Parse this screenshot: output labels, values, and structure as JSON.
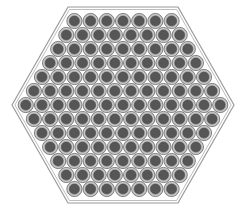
{
  "diagram": {
    "title": "",
    "type": "hexagonal-bundle-cross-section",
    "shape": "hexagon",
    "rows": [
      7,
      8,
      9,
      10,
      11,
      12,
      13,
      12,
      11,
      10,
      9,
      8,
      7
    ],
    "total_elements": 127,
    "geometry": {
      "center_x": 123,
      "center_y": 105,
      "pitch_x": 16.2,
      "pitch_y": 14,
      "outer_radius": 7.6,
      "ring_radius": 6.4,
      "core_radius": 5.0,
      "hex_vertices": [
        [
          12,
          105
        ],
        [
          68,
          7
        ],
        [
          178,
          7
        ],
        [
          234,
          105
        ],
        [
          178,
          203
        ],
        [
          68,
          203
        ]
      ],
      "hex_inner_offset": 2.5
    },
    "colors": {
      "background": "#ffffff",
      "hex_outline": "#9a9a9a",
      "hex_inner_outline": "#b5b5b5",
      "element_outline": "#6a6a6a",
      "element_ring": "#b4b4b4",
      "element_core": "#565656"
    }
  }
}
